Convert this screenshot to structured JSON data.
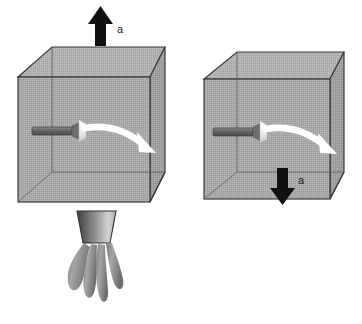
{
  "figure": {
    "background_color": "#ffffff",
    "width": 362,
    "height": 324,
    "panels": [
      {
        "id": "left-panel",
        "name": "box-with-rocket-thrust",
        "box": {
          "name": "transparent-box-left",
          "fill_color": "#a9a9a9",
          "top_face_color": "#b4b4b4",
          "side_face_color": "#9e9e9e",
          "edge_color": "#3a3a3a",
          "back_edge_color": "#6b6b6b"
        },
        "acceleration_arrow": {
          "name": "acceleration-arrow-up",
          "direction": "up",
          "label": "a",
          "color": "#111111",
          "position": "above-box"
        },
        "projectile": {
          "name": "dart-bolt",
          "color_dark": "#555555",
          "color_light": "#c8c8c8",
          "direction": "right"
        },
        "trajectory": {
          "name": "curved-trajectory-arrow",
          "color": "#ffffff",
          "curve": "downward-arc",
          "direction": "right"
        },
        "nozzle": {
          "name": "rocket-nozzle",
          "color_dark": "#4a4a4a",
          "color_light": "#d0d0d0"
        },
        "flame": {
          "name": "exhaust-flame",
          "color_dark": "#6e6e6e",
          "color_light": "#bdbdbd",
          "plume_count": 4
        }
      },
      {
        "id": "right-panel",
        "name": "box-in-free-fall",
        "box": {
          "name": "transparent-box-right",
          "fill_color": "#a9a9a9",
          "top_face_color": "#b4b4b4",
          "side_face_color": "#9e9e9e",
          "edge_color": "#3a3a3a",
          "back_edge_color": "#6b6b6b"
        },
        "acceleration_arrow": {
          "name": "acceleration-arrow-down",
          "direction": "down",
          "label": "a",
          "color": "#111111",
          "position": "inside-box"
        },
        "projectile": {
          "name": "dart-bolt",
          "color_dark": "#555555",
          "color_light": "#c8c8c8",
          "direction": "right"
        },
        "trajectory": {
          "name": "curved-trajectory-arrow",
          "color": "#ffffff",
          "curve": "downward-arc",
          "direction": "right"
        }
      }
    ]
  }
}
